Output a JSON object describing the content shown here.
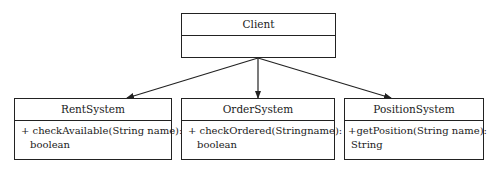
{
  "diagram": {
    "type": "UML class diagram",
    "classes": {
      "client": {
        "name": "Client",
        "operations": []
      },
      "rent": {
        "name": "RentSystem",
        "op_line1": "+ checkAvailable(String name):",
        "op_line2": "boolean"
      },
      "order": {
        "name": "OrderSystem",
        "op_line1": "+ checkOrdered(Stringname):",
        "op_line2": "boolean"
      },
      "position": {
        "name": "PositionSystem",
        "op_line1": "+getPosition(String name):",
        "op_line2": "String"
      }
    },
    "relationships": [
      {
        "from": "Client",
        "to": "RentSystem",
        "type": "association-arrow"
      },
      {
        "from": "Client",
        "to": "OrderSystem",
        "type": "association-arrow"
      },
      {
        "from": "Client",
        "to": "PositionSystem",
        "type": "association-arrow"
      }
    ]
  }
}
